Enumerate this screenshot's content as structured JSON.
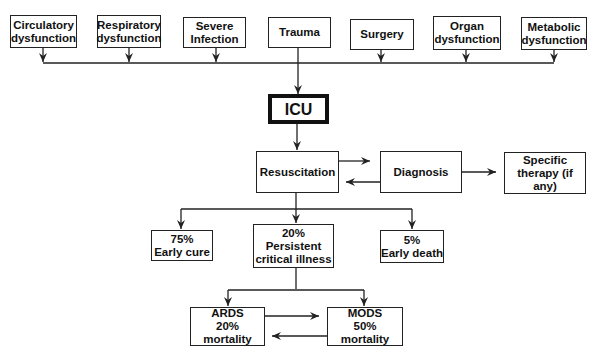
{
  "diagram": {
    "causes": [
      {
        "id": "circulatory",
        "label": "Circulatory\ndysfunction"
      },
      {
        "id": "respiratory",
        "label": "Respiratory\ndysfunction"
      },
      {
        "id": "infection",
        "label": "Severe\nInfection"
      },
      {
        "id": "trauma",
        "label": "Trauma"
      },
      {
        "id": "surgery",
        "label": "Surgery"
      },
      {
        "id": "organ",
        "label": "Organ\ndysfunction"
      },
      {
        "id": "metabolic",
        "label": "Metabolic\ndysfunction"
      }
    ],
    "icu": {
      "label": "ICU"
    },
    "resuscitation": {
      "label": "Resuscitation"
    },
    "diagnosis": {
      "label": "Diagnosis"
    },
    "specific_therapy": {
      "label": "Specific\ntherapy (if any)"
    },
    "outcomes": [
      {
        "id": "early-cure",
        "label": "75%\nEarly cure"
      },
      {
        "id": "persistent",
        "label": "20%\nPersistent\ncritical illness"
      },
      {
        "id": "early-death",
        "label": "5%\nEarly death"
      }
    ],
    "complications": [
      {
        "id": "ards",
        "label": "ARDS\n20% mortality"
      },
      {
        "id": "mods",
        "label": "MODS\n50% mortality"
      }
    ],
    "colors": {
      "line": "#222222",
      "background": "#ffffff"
    }
  }
}
